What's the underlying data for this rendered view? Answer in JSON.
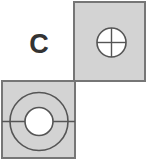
{
  "figure": {
    "panel_label": "C",
    "colors": {
      "background": "#ffffff",
      "square_fill": "#d3d3d3",
      "square_border": "#767676",
      "circle_fill": "#ffffff",
      "line_stroke": "#555555",
      "label": "#333333"
    },
    "tiles": [
      {
        "id": "top-right",
        "x": 74,
        "y": 2,
        "size": 79,
        "symbol": "small-circle-with-crosshair",
        "circle": {
          "cx": 111.5,
          "cy": 42.5,
          "r": 14.5
        }
      },
      {
        "id": "bottom-left",
        "x": 2,
        "y": 81,
        "size": 77,
        "symbol": "ring-with-horizontal-bisector",
        "outer_circle": {
          "cx": 39,
          "cy": 121.5,
          "r": 29
        },
        "inner_circle": {
          "cx": 39,
          "cy": 121.5,
          "r": 14
        }
      }
    ]
  }
}
